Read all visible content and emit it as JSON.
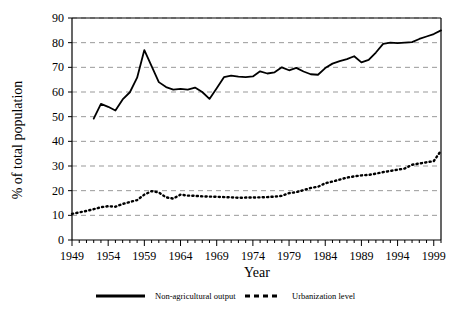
{
  "chart_data": {
    "type": "line",
    "title": "",
    "xlabel": "Year",
    "ylabel": "% of total population",
    "xlim": [
      1949,
      2000
    ],
    "ylim": [
      0,
      90
    ],
    "ytick_step": 10,
    "xtick_step": 5,
    "grid": true,
    "grid_axis": "y",
    "grid_style": "dashed",
    "legend_position": "bottom",
    "xticks": [
      "1949",
      "1954",
      "1959",
      "1964",
      "1969",
      "1974",
      "1979",
      "1984",
      "1989",
      "1994",
      "1999"
    ],
    "yticks": [
      "0",
      "10",
      "20",
      "30",
      "40",
      "50",
      "60",
      "70",
      "80",
      "90"
    ],
    "series": [
      {
        "name": "Non-agricultural output",
        "style": "solid",
        "color": "#000000",
        "x": [
          1952,
          1953,
          1954,
          1955,
          1956,
          1957,
          1958,
          1959,
          1960,
          1961,
          1962,
          1963,
          1964,
          1965,
          1966,
          1967,
          1968,
          1969,
          1970,
          1971,
          1972,
          1973,
          1974,
          1975,
          1976,
          1977,
          1978,
          1979,
          1980,
          1981,
          1982,
          1983,
          1984,
          1985,
          1986,
          1987,
          1988,
          1989,
          1990,
          1991,
          1992,
          1993,
          1994,
          1995,
          1996,
          1997,
          1998,
          1999,
          2000
        ],
        "values": [
          49.2,
          55.2,
          54.0,
          52.5,
          57.0,
          59.9,
          65.8,
          77.0,
          70.5,
          64.0,
          62.0,
          61.0,
          61.3,
          61.0,
          61.8,
          60.0,
          57.2,
          61.5,
          66.0,
          66.6,
          66.2,
          66.0,
          66.3,
          68.4,
          67.5,
          68.0,
          70.0,
          68.8,
          69.8,
          68.3,
          67.2,
          67.0,
          69.7,
          71.5,
          72.5,
          73.3,
          74.5,
          72.0,
          73.0,
          76.0,
          79.5,
          80.0,
          79.8,
          80.0,
          80.2,
          81.5,
          82.5,
          83.5,
          85.0
        ]
      },
      {
        "name": "Urbanization level",
        "style": "dashed",
        "color": "#000000",
        "x": [
          1949,
          1950,
          1951,
          1952,
          1953,
          1954,
          1955,
          1956,
          1957,
          1958,
          1959,
          1960,
          1961,
          1962,
          1963,
          1964,
          1965,
          1966,
          1967,
          1968,
          1969,
          1970,
          1971,
          1972,
          1973,
          1974,
          1975,
          1976,
          1977,
          1978,
          1979,
          1980,
          1981,
          1982,
          1983,
          1984,
          1985,
          1986,
          1987,
          1988,
          1989,
          1990,
          1991,
          1992,
          1993,
          1994,
          1995,
          1996,
          1997,
          1998,
          1999,
          2000
        ],
        "values": [
          10.6,
          11.2,
          11.8,
          12.5,
          13.3,
          13.7,
          13.5,
          14.6,
          15.4,
          16.2,
          18.4,
          19.8,
          19.3,
          17.3,
          16.8,
          18.4,
          18.0,
          17.9,
          17.7,
          17.6,
          17.5,
          17.4,
          17.3,
          17.1,
          17.2,
          17.2,
          17.3,
          17.4,
          17.6,
          17.9,
          19.0,
          19.4,
          20.2,
          21.1,
          21.6,
          23.0,
          23.7,
          24.5,
          25.3,
          25.8,
          26.2,
          26.4,
          26.9,
          27.5,
          28.0,
          28.5,
          29.0,
          30.5,
          31.0,
          31.5,
          32.0,
          36.2
        ]
      }
    ]
  },
  "legend": {
    "items": [
      {
        "label": "Non-agricultural output",
        "style": "solid"
      },
      {
        "label": "Urbanization level",
        "style": "dashed"
      }
    ]
  },
  "colors": {
    "axis": "#000000",
    "grid": "#999999",
    "line": "#000000",
    "background": "#ffffff"
  }
}
